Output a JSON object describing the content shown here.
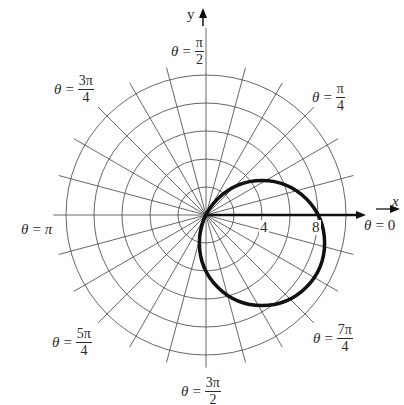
{
  "figure": {
    "type": "polar-graph",
    "center_px": [
      206,
      215
    ],
    "px_per_unit": 14,
    "grid": {
      "ring_radii_units": [
        2,
        4,
        6,
        8,
        10
      ],
      "spoke_step_deg": 15,
      "spoke_length_units": 10.9,
      "color": "#555555"
    },
    "curve": {
      "equation": "r = 8cos(theta) - 4sin(theta)",
      "a": 8,
      "b": -4,
      "color": "#111111",
      "stroke_width": 3.5
    },
    "axes": {
      "x_label": "x",
      "y_label": "y",
      "tick_labels": [
        {
          "text": "4",
          "value": 4
        },
        {
          "text": "8",
          "value": 8
        }
      ]
    },
    "angle_labels": [
      {
        "id": "pi-over-2",
        "theta": "θ",
        "eq": "=",
        "num": "π",
        "den": "2"
      },
      {
        "id": "3pi-over-4",
        "theta": "θ",
        "eq": "=",
        "num": "3π",
        "den": "4"
      },
      {
        "id": "pi-over-4",
        "theta": "θ",
        "eq": "=",
        "num": "π",
        "den": "4"
      },
      {
        "id": "pi",
        "theta": "θ",
        "eq": "=",
        "value": "π"
      },
      {
        "id": "zero",
        "theta": "θ",
        "eq": "=",
        "value": "0"
      },
      {
        "id": "5pi-over-4",
        "theta": "θ",
        "eq": "=",
        "num": "5π",
        "den": "4"
      },
      {
        "id": "7pi-over-4",
        "theta": "θ",
        "eq": "=",
        "num": "7π",
        "den": "4"
      },
      {
        "id": "3pi-over-2",
        "theta": "θ",
        "eq": "=",
        "num": "3π",
        "den": "2"
      }
    ]
  }
}
